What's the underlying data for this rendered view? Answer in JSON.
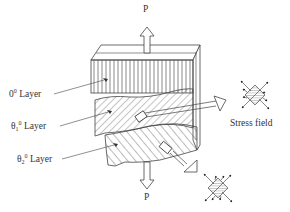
{
  "diagram": {
    "type": "laminate-stress-schematic",
    "load": {
      "top_label": "P",
      "bottom_label": "P"
    },
    "layers": [
      {
        "symbol": "0",
        "superscript": "0",
        "subscript": "",
        "word": "Layer",
        "hatch": "vertical"
      },
      {
        "symbol": "θ",
        "superscript": "0",
        "subscript": "1",
        "word": "Layer",
        "hatch": "diagonal-fine"
      },
      {
        "symbol": "θ",
        "superscript": "0",
        "subscript": "2",
        "word": "Layer",
        "hatch": "diagonal-coarse"
      }
    ],
    "stress_field_label": "Stress field",
    "colors": {
      "line": "#444444",
      "background": "#ffffff",
      "text": "#333333"
    }
  }
}
